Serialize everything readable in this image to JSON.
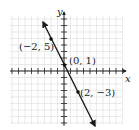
{
  "chart_data": {
    "type": "line",
    "title": "",
    "xlabel": "x",
    "ylabel": "y",
    "xlim": [
      -8,
      9
    ],
    "ylim": [
      -9,
      9
    ],
    "grid": true,
    "line": {
      "equation": "y = -2x + 1",
      "slope": -2,
      "intercept": 1,
      "arrows": "both"
    },
    "points": [
      {
        "x": -2,
        "y": 5,
        "label": "(−2, 5)"
      },
      {
        "x": 0,
        "y": 1,
        "label": "(0, 1)"
      },
      {
        "x": 2,
        "y": -3,
        "label": "(2, −3)"
      }
    ]
  },
  "labels": {
    "x_axis": "x",
    "y_axis": "y",
    "p1": "(−2, 5)",
    "p2": "(0, 1)",
    "p3": "(2, −3)"
  },
  "colors": {
    "grid": "#d8d8d8",
    "axis": "#222222",
    "line": "#1a1a1a"
  }
}
